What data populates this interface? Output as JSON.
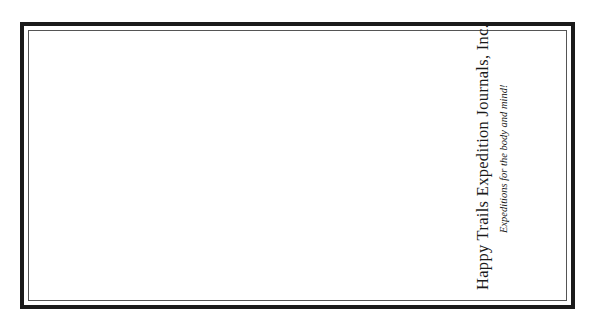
{
  "card": {
    "company_name": "Happy Trails Expedition Journals, Inc.",
    "tagline": "Expeditions for the body and mind!",
    "colors": {
      "frame": "#1a1a1a",
      "inner_line": "#555555",
      "background": "#ffffff",
      "text": "#1a1a1a"
    }
  }
}
